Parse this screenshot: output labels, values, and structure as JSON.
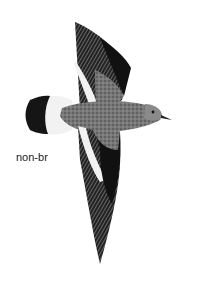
{
  "illustration": {
    "subject": "bird-in-flight",
    "plumage_label": "non-br",
    "colors": {
      "background": "#ffffff",
      "body": "#7a7a7a",
      "dark_feathers": "#1a1a1a",
      "wing_bar": "#f2f2f2",
      "label": "#222222"
    }
  }
}
